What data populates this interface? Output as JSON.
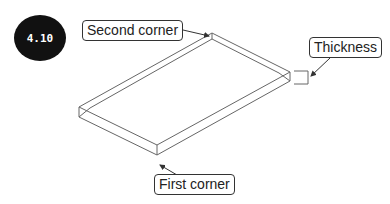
{
  "figure": {
    "badge_label": "4.10",
    "callouts": {
      "second_corner": "Second corner",
      "thickness": "Thickness",
      "first_corner": "First corner"
    },
    "colors": {
      "badge_bg": "#111111",
      "line": "#555555"
    }
  }
}
